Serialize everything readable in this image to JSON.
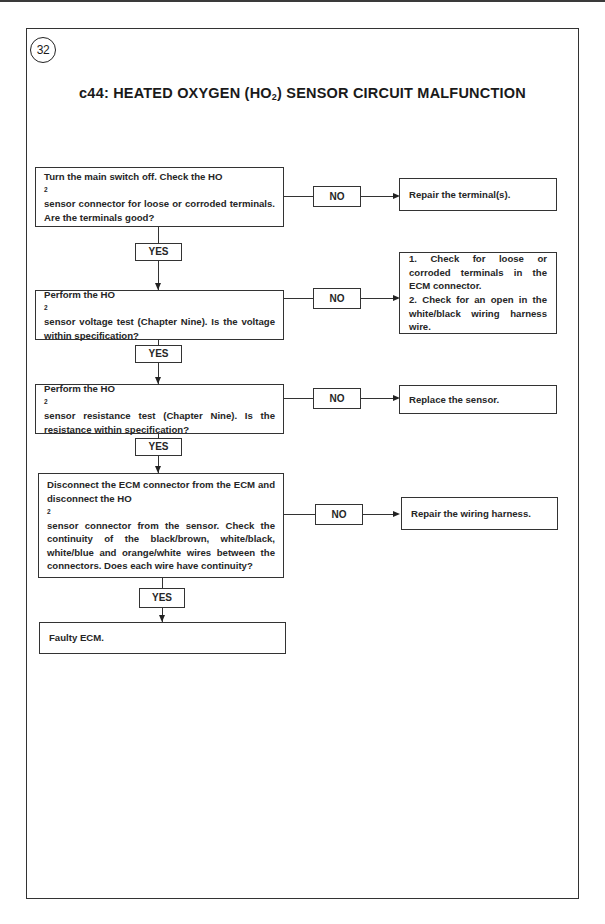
{
  "figure": {
    "number": "32",
    "title_prefix": "c44: HEATED OXYGEN (HO",
    "title_sub": "2",
    "title_suffix": ") SENSOR CIRCUIT MALFUNCTION"
  },
  "labels": {
    "yes": "YES",
    "no": "NO"
  },
  "steps": [
    {
      "question_parts": [
        "Turn the main switch off. Check the HO",
        "2",
        " sensor connector for loose or corroded terminals. Are the terminals good?"
      ],
      "no_result": "Repair the terminal(s)."
    },
    {
      "question_parts": [
        "Perform the HO",
        "2",
        " sensor voltage test (Chapter Nine). Is the voltage within specification?"
      ],
      "no_result_lines": [
        "1. Check for loose or corroded terminals in the ECM connector.",
        "2. Check for an open in the white/black wiring harness wire."
      ]
    },
    {
      "question_parts": [
        "Perform the HO",
        "2",
        " sensor resistance test (Chapter Nine). Is the resistance within specification?"
      ],
      "no_result": "Replace the sensor."
    },
    {
      "question_parts": [
        "Disconnect the ECM connector from the ECM and disconnect the HO",
        "2",
        " sensor connector from the sensor. Check the continuity of the black/brown, white/black, white/blue and orange/white wires between the connectors. Does each wire have continuity?"
      ],
      "no_result": "Repair the wiring harness."
    }
  ],
  "final_result": "Faulty ECM."
}
